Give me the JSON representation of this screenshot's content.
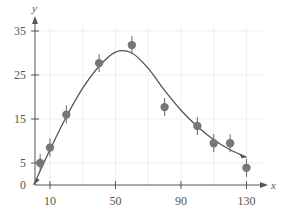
{
  "chart_data": {
    "type": "scatter",
    "title": "",
    "xlabel": "x",
    "ylabel": "y",
    "x_ticks": [
      10,
      50,
      90,
      130
    ],
    "y_ticks": [
      0,
      5,
      15,
      25,
      35
    ],
    "xlim": [
      0,
      140
    ],
    "ylim": [
      0,
      38
    ],
    "grid": true,
    "legend": null,
    "series": [
      {
        "name": "data points",
        "type": "scatter",
        "x": [
          4,
          10,
          20,
          40,
          60,
          80,
          100,
          110,
          120,
          130
        ],
        "y": [
          5,
          8.5,
          16,
          27.7,
          31.8,
          17.7,
          13.4,
          9.5,
          9.5,
          3.9
        ]
      },
      {
        "name": "fitted curve",
        "type": "line",
        "x": [
          0,
          10,
          20,
          30,
          40,
          50,
          60,
          70,
          80,
          90,
          100,
          110,
          120,
          130
        ],
        "y": [
          0,
          8,
          15.5,
          22,
          27,
          30.2,
          30,
          26.5,
          21.5,
          17,
          13.3,
          10.3,
          8,
          6.3
        ]
      }
    ]
  },
  "axes": {
    "x_label": "x",
    "y_label": "y",
    "x_tick_labels": [
      "10",
      "50",
      "90",
      "130"
    ],
    "y_tick_labels": [
      "0",
      "5",
      "15",
      "25",
      "35"
    ]
  },
  "colors": {
    "axis": "#555555",
    "curve": "#555555",
    "points": "#777777",
    "grid": "#eeeeee"
  }
}
